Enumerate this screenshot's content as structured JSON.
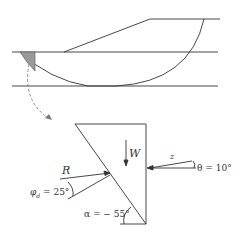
{
  "diagram": {
    "type": "slope stability slice force diagram",
    "labels": {
      "weight": "W",
      "resultant": "R",
      "interslice_force": "z",
      "theta": "θ = 10°",
      "phi_d": "φ",
      "phi_sub": "d",
      "phi_value": " = 25°",
      "alpha": "α = − 55°"
    },
    "colors": {
      "line": "#333333",
      "shade": "#9a9a9a",
      "dashed": "#777777"
    }
  }
}
